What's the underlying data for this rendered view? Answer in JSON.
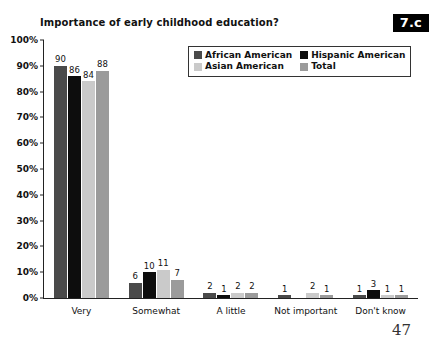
{
  "chart_data": {
    "type": "bar",
    "title": "Importance of early childhood education?",
    "xlabel": "",
    "ylabel": "",
    "ylim": [
      0,
      100
    ],
    "ytick_labels": [
      "100%",
      "90%",
      "80%",
      "70%",
      "60%",
      "50%",
      "40%",
      "30%",
      "20%",
      "10%",
      "0%"
    ],
    "ytick_values": [
      100,
      90,
      80,
      70,
      60,
      50,
      40,
      30,
      20,
      10,
      0
    ],
    "grid": false,
    "legend_position": "top-center",
    "categories": [
      "Very",
      "Somewhat",
      "A little",
      "Not important",
      "Don't know"
    ],
    "series": [
      {
        "name": "African American",
        "color": "#4a4a4a",
        "values": [
          90,
          6,
          2,
          1,
          1
        ],
        "labels": [
          "90",
          "6",
          "2",
          "1",
          "1"
        ]
      },
      {
        "name": "Hispanic American",
        "color": "#0d0d0d",
        "values": [
          86,
          10,
          1,
          0,
          3
        ],
        "labels": [
          "86",
          "10",
          "1",
          "",
          "3"
        ]
      },
      {
        "name": "Asian American",
        "color": "#cacaca",
        "values": [
          84,
          11,
          2,
          2,
          1
        ],
        "labels": [
          "84",
          "11",
          "2",
          "2",
          "1"
        ]
      },
      {
        "name": "Total",
        "color": "#9b9b9b",
        "values": [
          88,
          7,
          2,
          1,
          1
        ],
        "labels": [
          "88",
          "7",
          "2",
          "1",
          "1"
        ]
      }
    ]
  },
  "badge": {
    "label": "7.c"
  },
  "page": {
    "number": "47"
  }
}
